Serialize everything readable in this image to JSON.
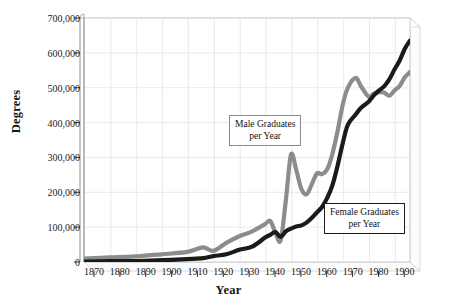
{
  "chart_data": {
    "type": "line",
    "title": "",
    "xlabel": "Year",
    "ylabel": "Degrees",
    "xlim": [
      1870,
      1996
    ],
    "ylim": [
      0,
      700000
    ],
    "grid": true,
    "legend_position": "inline-annotations",
    "x_ticks": [
      1870,
      1880,
      1890,
      1900,
      1910,
      1920,
      1930,
      1940,
      1950,
      1960,
      1970,
      1980,
      1990
    ],
    "y_ticks": [
      0,
      100000,
      200000,
      300000,
      400000,
      500000,
      600000,
      700000
    ],
    "y_tick_labels": [
      "0",
      "100,000",
      "200,000",
      "300,000",
      "400,000",
      "500,000",
      "600,000",
      "700,000"
    ],
    "x_tick_labels": [
      "1870",
      "1880",
      "1890",
      "1900",
      "1910",
      "1920",
      "1930",
      "1940",
      "1950",
      "1960",
      "1970",
      "1980",
      "1990"
    ],
    "series": [
      {
        "name": "Male Graduates per Year",
        "color": "#8c8c8c",
        "x": [
          1870,
          1880,
          1890,
          1900,
          1910,
          1916,
          1920,
          1925,
          1930,
          1935,
          1940,
          1942,
          1944,
          1946,
          1948,
          1950,
          1952,
          1954,
          1956,
          1958,
          1960,
          1962,
          1964,
          1966,
          1968,
          1970,
          1972,
          1975,
          1977,
          1980,
          1982,
          1984,
          1986,
          1988,
          1990,
          1992,
          1994,
          1996
        ],
        "values": [
          9400,
          13000,
          16000,
          22000,
          29000,
          42000,
          32000,
          55000,
          74000,
          88000,
          109000,
          118000,
          84000,
          62000,
          176000,
          308000,
          265000,
          210000,
          194000,
          222000,
          254000,
          252000,
          266000,
          310000,
          375000,
          451000,
          500000,
          528000,
          505000,
          474000,
          483000,
          487000,
          486000,
          477000,
          492000,
          505000,
          530000,
          545000
        ]
      },
      {
        "name": "Female Graduates per Year",
        "color": "#1a1a1a",
        "x": [
          1870,
          1880,
          1890,
          1900,
          1910,
          1916,
          1920,
          1925,
          1930,
          1935,
          1940,
          1942,
          1944,
          1946,
          1948,
          1950,
          1952,
          1954,
          1956,
          1958,
          1960,
          1962,
          1964,
          1966,
          1968,
          1970,
          1972,
          1975,
          1977,
          1980,
          1982,
          1984,
          1986,
          1988,
          1990,
          1992,
          1994,
          1996
        ],
        "values": [
          1400,
          2500,
          2700,
          5200,
          8400,
          11000,
          17000,
          22000,
          35000,
          44000,
          70000,
          78000,
          86000,
          72000,
          88000,
          96000,
          102000,
          105000,
          113000,
          126000,
          142000,
          158000,
          184000,
          220000,
          276000,
          341000,
          394000,
          423000,
          442000,
          460000,
          478000,
          492000,
          504000,
          524000,
          552000,
          578000,
          612000,
          635000
        ]
      }
    ],
    "annotations": [
      {
        "id": "male",
        "line1": "Male Graduates",
        "line2": "per Year",
        "border_color": "#8a8a8a"
      },
      {
        "id": "female",
        "line1": "Female Graduates",
        "line2": "per Year",
        "border_color": "#1a1a1a"
      }
    ]
  }
}
